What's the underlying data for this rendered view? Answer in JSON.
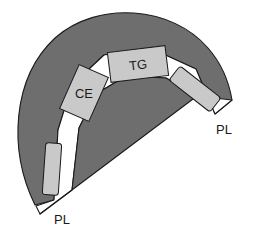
{
  "figure": {
    "type": "anatomical-schematic",
    "title": "",
    "background_color": "#ffffff"
  },
  "colors": {
    "tissue_dark": "#6e6e6e",
    "band_white": "#ffffff",
    "block_light_gray": "#c9c9c9",
    "outline": "#1a1a1a",
    "label_text": "#1a1a1a"
  },
  "regions": {
    "outer_tissue": {
      "name": "outer-crescent-region",
      "fill": "#6e6e6e"
    },
    "inner_tissue": {
      "name": "inner-wedge-region",
      "fill": "#6e6e6e"
    },
    "white_band": {
      "name": "white-band-region",
      "fill": "#ffffff"
    }
  },
  "blocks": [
    {
      "id": "tg",
      "label": "TG",
      "fill": "#c9c9c9",
      "rotation_deg": -7,
      "cx": 138,
      "cy": 64,
      "w": 58,
      "h": 30
    },
    {
      "id": "ce",
      "label": "CE",
      "fill": "#c9c9c9",
      "rotation_deg": 24,
      "cx": 84,
      "cy": 93,
      "w": 32,
      "h": 48
    },
    {
      "id": "right-block",
      "label": "",
      "fill": "#c9c9c9",
      "rotation_deg": 38,
      "cx": 195,
      "cy": 89,
      "w": 52,
      "h": 18
    },
    {
      "id": "bottom-left-block",
      "label": "",
      "fill": "#c9c9c9",
      "rotation_deg": 4,
      "cx": 52,
      "cy": 169,
      "w": 16,
      "h": 52
    }
  ],
  "annotations": [
    {
      "id": "pl-right",
      "label": "PL",
      "x": 224,
      "y": 129
    },
    {
      "id": "pl-bottom-left",
      "label": "PL",
      "x": 62,
      "y": 219
    }
  ],
  "legend_keys": {
    "tg": "TG",
    "ce": "CE",
    "pl": "PL"
  }
}
